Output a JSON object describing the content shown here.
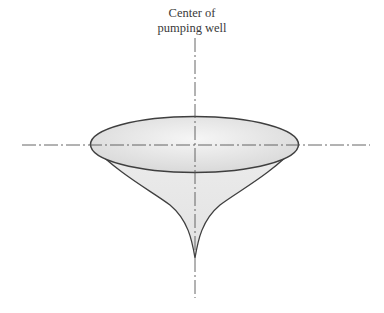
{
  "diagram": {
    "title_line1": "Center of",
    "title_line2": "pumping well",
    "colors": {
      "stroke": "#3f3f3f",
      "fill_light": "#f4f4f4",
      "fill_dark": "#d6d6d6",
      "centerline": "#555555"
    }
  }
}
